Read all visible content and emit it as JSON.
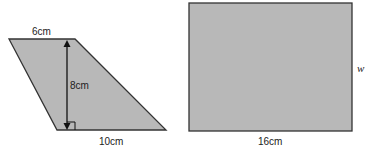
{
  "diagram": {
    "colors": {
      "fill": "#b8b8b8",
      "stroke": "#333333",
      "background": "#ffffff"
    },
    "trapezoid": {
      "top_label": "6cm",
      "height_label": "8cm",
      "bottom_label": "10cm"
    },
    "rectangle": {
      "bottom_label": "16cm",
      "side_label": "w"
    }
  }
}
